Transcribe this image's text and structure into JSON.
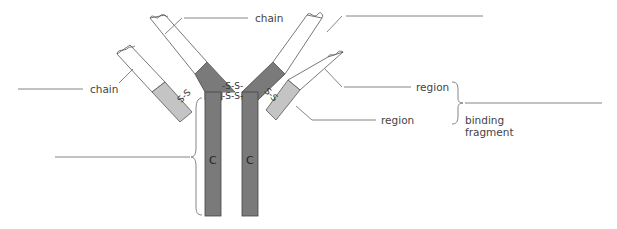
{
  "diagram": {
    "type": "antibody-structure",
    "colors": {
      "constant_dark": "#7a7a7a",
      "variable_light": "#c4c4c4",
      "white_region": "#ffffff",
      "outline": "#555555",
      "leader_line": "#666666"
    },
    "labels": {
      "heavy_chain": "chain",
      "light_chain": "chain",
      "variable_region": "region",
      "constant_region": "region",
      "fab_line1": "binding",
      "fab_line2": "fragment",
      "stem_c_left": "C",
      "stem_c_right": "C",
      "disulfide_top": "-S-S-",
      "disulfide_bottom": "-S-S-",
      "disulfide_left": "S-S",
      "disulfide_right": "S-S"
    },
    "blanks": [
      {
        "id": "blank-top-right",
        "label": ""
      },
      {
        "id": "blank-heavy-chain-prefix",
        "label": ""
      },
      {
        "id": "blank-light-chain-prefix",
        "label": ""
      },
      {
        "id": "blank-fab-prefix",
        "label": ""
      },
      {
        "id": "blank-fc",
        "label": ""
      }
    ]
  }
}
